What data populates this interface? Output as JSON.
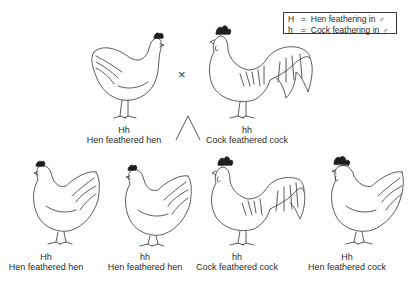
{
  "legend": {
    "rows": [
      {
        "symbol": "H",
        "equals": "=",
        "text": "Hen feathering in",
        "sex_symbol": "♂"
      },
      {
        "symbol": "h",
        "equals": "=",
        "text": "Cock feathering in",
        "sex_symbol": "♂"
      }
    ]
  },
  "cross_symbol": "×",
  "parents": [
    {
      "genotype": "Hh",
      "phenotype": "Hen feathered hen",
      "icon": "hen-illustration"
    },
    {
      "genotype": "hh",
      "phenotype": "Cock feathered cock",
      "icon": "rooster-illustration"
    }
  ],
  "offspring": [
    {
      "genotype": "Hh",
      "phenotype": "Hen feathered hen",
      "icon": "hen-illustration"
    },
    {
      "genotype": "hh",
      "phenotype": "Hen feathered hen",
      "icon": "hen-illustration"
    },
    {
      "genotype": "hh",
      "phenotype": "Cock feathered cock",
      "icon": "rooster-illustration"
    },
    {
      "genotype": "Hh",
      "phenotype": "Hen feathered cock",
      "icon": "hen-feathered-cock-illustration"
    }
  ]
}
